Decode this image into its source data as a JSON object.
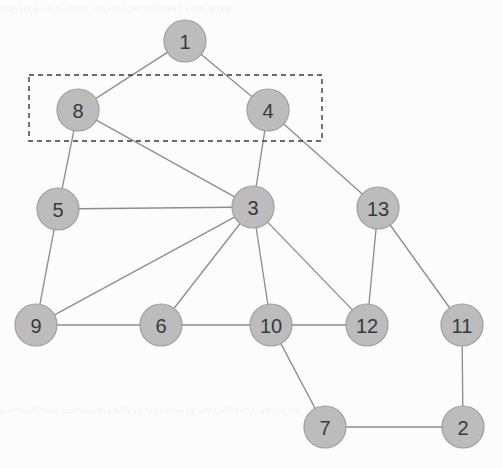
{
  "figure": {
    "background_color": "#fcfcfc",
    "node_fill_color": "#bcbcbc",
    "node_stroke_color": "#9d9d9d",
    "edge_color": "#8e8e8e",
    "label_color": "#39393c",
    "selection_stroke_color": "#3a3a3a"
  },
  "bleed_text": {
    "top": "nagybet kft mm ibse a sett attoh wa nedkeuan a tom arrets",
    "bottom": "mor sealh vdse mav mm seo bdft      ve        szl adhtia eg seb t vbkkv ljo gn voi tmr"
  },
  "graph_data": {
    "type": "node-link-diagram",
    "node_radius": 21,
    "nodes": [
      {
        "id": "1",
        "label": "1",
        "x": 185,
        "y": 41,
        "selected": false
      },
      {
        "id": "8",
        "label": "8",
        "x": 78,
        "y": 110,
        "selected": true
      },
      {
        "id": "4",
        "label": "4",
        "x": 268,
        "y": 110,
        "selected": true
      },
      {
        "id": "5",
        "label": "5",
        "x": 58,
        "y": 209,
        "selected": false
      },
      {
        "id": "3",
        "label": "3",
        "x": 253,
        "y": 207,
        "selected": false
      },
      {
        "id": "13",
        "label": "13",
        "x": 378,
        "y": 208,
        "selected": false
      },
      {
        "id": "9",
        "label": "9",
        "x": 36,
        "y": 325,
        "selected": false
      },
      {
        "id": "6",
        "label": "6",
        "x": 161,
        "y": 325,
        "selected": false
      },
      {
        "id": "10",
        "label": "10",
        "x": 271,
        "y": 325,
        "selected": false
      },
      {
        "id": "12",
        "label": "12",
        "x": 367,
        "y": 325,
        "selected": false
      },
      {
        "id": "11",
        "label": "11",
        "x": 462,
        "y": 325,
        "selected": false
      },
      {
        "id": "7",
        "label": "7",
        "x": 325,
        "y": 427,
        "selected": false
      },
      {
        "id": "2",
        "label": "2",
        "x": 463,
        "y": 427,
        "selected": false
      }
    ],
    "edges": [
      {
        "source": "1",
        "target": "8"
      },
      {
        "source": "1",
        "target": "4"
      },
      {
        "source": "8",
        "target": "5"
      },
      {
        "source": "8",
        "target": "3"
      },
      {
        "source": "4",
        "target": "3"
      },
      {
        "source": "4",
        "target": "13"
      },
      {
        "source": "5",
        "target": "3"
      },
      {
        "source": "5",
        "target": "9"
      },
      {
        "source": "9",
        "target": "3"
      },
      {
        "source": "9",
        "target": "6"
      },
      {
        "source": "6",
        "target": "3"
      },
      {
        "source": "6",
        "target": "10"
      },
      {
        "source": "3",
        "target": "10"
      },
      {
        "source": "3",
        "target": "12"
      },
      {
        "source": "13",
        "target": "12"
      },
      {
        "source": "13",
        "target": "11"
      },
      {
        "source": "10",
        "target": "12"
      },
      {
        "source": "10",
        "target": "7"
      },
      {
        "source": "11",
        "target": "2"
      },
      {
        "source": "7",
        "target": "2"
      }
    ],
    "selection_box": {
      "x": 29,
      "y": 75,
      "width": 293,
      "height": 66
    }
  }
}
